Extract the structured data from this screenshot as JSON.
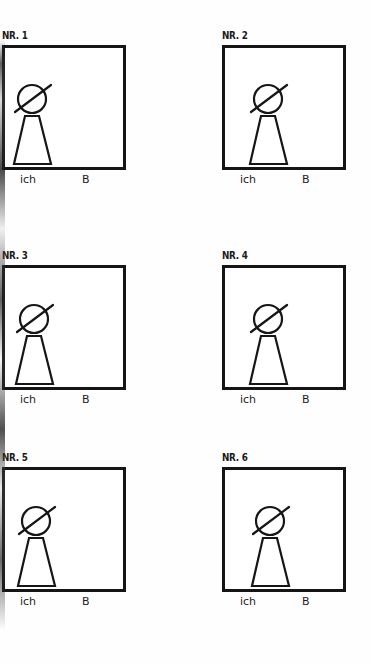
{
  "document": {
    "type": "worksheet",
    "background_color": "#ffffff",
    "ink_color": "#151515",
    "panel_count": 6,
    "columns": 2,
    "rows": 3
  },
  "labels": {
    "left_caption": "ich",
    "right_caption": "B"
  },
  "panels": [
    {
      "id": "panel-1",
      "number_label": "NR. 1",
      "caption_left": "ich",
      "caption_right": "B",
      "figure": {
        "name": "crossed-circle-head-figure",
        "head": "crossed-circle",
        "body": "trapezoid",
        "position_in_box": "left",
        "offset_x_px": 6
      }
    },
    {
      "id": "panel-2",
      "number_label": "NR. 2",
      "caption_left": "ich",
      "caption_right": "B",
      "figure": {
        "name": "crossed-circle-head-figure",
        "head": "crossed-circle",
        "body": "trapezoid",
        "position_in_box": "left-of-center",
        "offset_x_px": 22
      }
    },
    {
      "id": "panel-3",
      "number_label": "NR. 3",
      "caption_left": "ich",
      "caption_right": "B",
      "figure": {
        "name": "crossed-circle-head-figure",
        "head": "crossed-circle",
        "body": "trapezoid",
        "position_in_box": "left",
        "offset_x_px": 8
      }
    },
    {
      "id": "panel-4",
      "number_label": "NR. 4",
      "caption_left": "ich",
      "caption_right": "B",
      "figure": {
        "name": "crossed-circle-head-figure",
        "head": "crossed-circle",
        "body": "trapezoid",
        "position_in_box": "left-of-center",
        "offset_x_px": 22
      }
    },
    {
      "id": "panel-5",
      "number_label": "NR. 5",
      "caption_left": "ich",
      "caption_right": "B",
      "figure": {
        "name": "crossed-circle-head-figure",
        "head": "crossed-circle",
        "body": "trapezoid",
        "position_in_box": "left",
        "offset_x_px": 10
      }
    },
    {
      "id": "panel-6",
      "number_label": "NR. 6",
      "caption_left": "ich",
      "caption_right": "B",
      "figure": {
        "name": "crossed-circle-head-figure",
        "head": "crossed-circle",
        "body": "trapezoid",
        "position_in_box": "left-of-center",
        "offset_x_px": 24
      }
    }
  ]
}
